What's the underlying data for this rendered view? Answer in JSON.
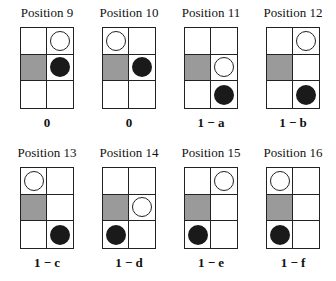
{
  "diagram": {
    "rows": 2,
    "grid_size": {
      "cols": 2,
      "rows": 3
    },
    "colors": {
      "shaded": "#9a9a9a",
      "black_piece": "#1a1a1a",
      "white_piece": "#ffffff",
      "line": "#222222"
    },
    "positions": [
      {
        "title": "Position 9",
        "value": "0",
        "shaded": [
          [
            1,
            0
          ]
        ],
        "white": [
          [
            0,
            1
          ]
        ],
        "black": [
          [
            1,
            1
          ]
        ]
      },
      {
        "title": "Position 10",
        "value": "0",
        "shaded": [
          [
            1,
            0
          ]
        ],
        "white": [
          [
            0,
            0
          ]
        ],
        "black": [
          [
            1,
            1
          ]
        ]
      },
      {
        "title": "Position 11",
        "value": "1 − a",
        "shaded": [
          [
            1,
            0
          ]
        ],
        "white": [
          [
            1,
            1
          ]
        ],
        "black": [
          [
            2,
            1
          ]
        ]
      },
      {
        "title": "Position 12",
        "value": "1 − b",
        "shaded": [
          [
            1,
            0
          ]
        ],
        "white": [
          [
            0,
            1
          ]
        ],
        "black": [
          [
            2,
            1
          ]
        ]
      },
      {
        "title": "Position 13",
        "value": "1 − c",
        "shaded": [
          [
            1,
            0
          ]
        ],
        "white": [
          [
            0,
            0
          ]
        ],
        "black": [
          [
            2,
            1
          ]
        ]
      },
      {
        "title": "Position 14",
        "value": "1 − d",
        "shaded": [
          [
            1,
            0
          ]
        ],
        "white": [
          [
            1,
            1
          ]
        ],
        "black": [
          [
            2,
            0
          ]
        ]
      },
      {
        "title": "Position 15",
        "value": "1 − e",
        "shaded": [
          [
            1,
            0
          ]
        ],
        "white": [
          [
            0,
            1
          ]
        ],
        "black": [
          [
            2,
            0
          ]
        ]
      },
      {
        "title": "Position 16",
        "value": "1 − f",
        "shaded": [
          [
            1,
            0
          ]
        ],
        "white": [
          [
            0,
            0
          ]
        ],
        "black": [
          [
            2,
            0
          ]
        ]
      }
    ]
  }
}
